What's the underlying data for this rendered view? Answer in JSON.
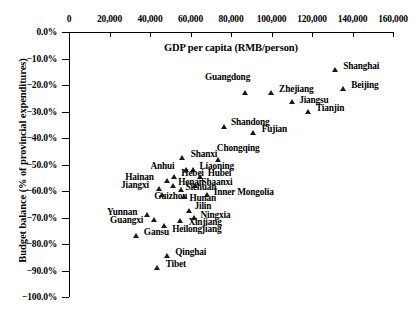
{
  "chart_data": {
    "type": "scatter",
    "title": "",
    "xlabel": "GDP per capita (RMB/person)",
    "ylabel": "Budget balance (% of provincial expenditures)",
    "xlim": [
      0,
      160000
    ],
    "ylim": [
      -100,
      0
    ],
    "xticks": [
      "0",
      "20,000",
      "40,000",
      "60,000",
      "80,000",
      "100,000",
      "120,000",
      "140,000",
      "160,000"
    ],
    "xtick_values": [
      0,
      20000,
      40000,
      60000,
      80000,
      100000,
      120000,
      140000,
      160000
    ],
    "yticks": [
      "0.0%",
      "−10.0%",
      "−20.0%",
      "−30.0%",
      "−40.0%",
      "−50.0%",
      "−60.0%",
      "−70.0%",
      "−80.0%",
      "−90.0%",
      "−100.0%"
    ],
    "ytick_values": [
      0,
      -10,
      -20,
      -30,
      -40,
      -50,
      -60,
      -70,
      -80,
      -90,
      -100
    ],
    "grid": false,
    "legend": "none",
    "marker": "triangle-up",
    "marker_color": "#1a1a1a",
    "points": [
      {
        "label": "Shanghai",
        "x": 131500,
        "y": -14.3,
        "lx": 8,
        "ly": -4
      },
      {
        "label": "Beijing",
        "x": 135400,
        "y": -21.5,
        "lx": 8,
        "ly": -4
      },
      {
        "label": "Zhejiang",
        "x": 99800,
        "y": -23.0,
        "lx": 8,
        "ly": -4
      },
      {
        "label": "Guangdong",
        "x": 86900,
        "y": -23.0,
        "lx": -40,
        "ly": -16
      },
      {
        "label": "Jiangsu",
        "x": 110200,
        "y": -26.4,
        "lx": 7,
        "ly": -2
      },
      {
        "label": "Tianjin",
        "x": 118000,
        "y": -30.2,
        "lx": 8,
        "ly": -4
      },
      {
        "label": "Shandong",
        "x": 76500,
        "y": -35.8,
        "lx": 7,
        "ly": -5
      },
      {
        "label": "Fujian",
        "x": 91200,
        "y": -38.1,
        "lx": 8,
        "ly": -4
      },
      {
        "label": "Shanxi",
        "x": 56200,
        "y": -47.6,
        "lx": 8,
        "ly": -4
      },
      {
        "label": "Chongqing",
        "x": 74000,
        "y": -48.3,
        "lx": -2,
        "ly": -12
      },
      {
        "label": "Anhui",
        "x": 58000,
        "y": -52.1,
        "lx": -36,
        "ly": -4
      },
      {
        "label": "Liaoning",
        "x": 61500,
        "y": -52.1,
        "lx": 6,
        "ly": -4
      },
      {
        "label": "Hebei",
        "x": 52000,
        "y": -54.7,
        "lx": 7,
        "ly": -4
      },
      {
        "label": "Hubei",
        "x": 65000,
        "y": -54.7,
        "lx": 7,
        "ly": -4
      },
      {
        "label": "Hainan",
        "x": 48500,
        "y": -56.2,
        "lx": -42,
        "ly": -4
      },
      {
        "label": "Henan",
        "x": 51500,
        "y": -58.1,
        "lx": 5,
        "ly": -4
      },
      {
        "label": "Shaanxi",
        "x": 62500,
        "y": -58.1,
        "lx": 6,
        "ly": -4
      },
      {
        "label": "Jiangxi",
        "x": 44500,
        "y": -59.2,
        "lx": -38,
        "ly": -4
      },
      {
        "label": "Sichuan",
        "x": 55500,
        "y": -59.6,
        "lx": 4,
        "ly": -3
      },
      {
        "label": "Guizhou",
        "x": 46000,
        "y": -61.3,
        "lx": -8,
        "ly": 2
      },
      {
        "label": "Hunan",
        "x": 57000,
        "y": -62.0,
        "lx": 5,
        "ly": 2
      },
      {
        "label": "Inner Mongolia",
        "x": 68500,
        "y": -61.3,
        "lx": 6,
        "ly": -2
      },
      {
        "label": "Jilin",
        "x": 59500,
        "y": -67.5,
        "lx": 5,
        "ly": -5
      },
      {
        "label": "Yunnan",
        "x": 38500,
        "y": -69.0,
        "lx": -40,
        "ly": -3
      },
      {
        "label": "Ningxia",
        "x": 62000,
        "y": -70.2,
        "lx": 6,
        "ly": -3
      },
      {
        "label": "Guangxi",
        "x": 42000,
        "y": -70.8,
        "lx": -44,
        "ly": 0
      },
      {
        "label": "Xinjiang",
        "x": 55000,
        "y": -71.3,
        "lx": 8,
        "ly": 1
      },
      {
        "label": "Heilongjiang",
        "x": 47000,
        "y": -73.2,
        "lx": 8,
        "ly": 3
      },
      {
        "label": "Gansu",
        "x": 33500,
        "y": -77.0,
        "lx": 7,
        "ly": -4
      },
      {
        "label": "Qinghai",
        "x": 48500,
        "y": -84.5,
        "lx": 8,
        "ly": -4
      },
      {
        "label": "Tibet",
        "x": 43800,
        "y": -89.0,
        "lx": 8,
        "ly": -4
      }
    ]
  }
}
